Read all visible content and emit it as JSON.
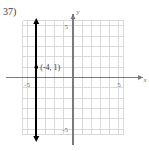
{
  "problem": {
    "number_label": "37)"
  },
  "chart_data": {
    "type": "line",
    "title": "",
    "xlabel": "x",
    "ylabel": "y",
    "xlim": [
      -6,
      6
    ],
    "ylim": [
      -6,
      6
    ],
    "grid": true,
    "grid_step": 1,
    "grid_color": "#d9d9d9",
    "axis_color": "#7a7a7a",
    "legend": "none",
    "x_tick_labels": [
      {
        "value": -5,
        "text": "-5"
      },
      {
        "value": 5,
        "text": "5"
      }
    ],
    "y_tick_labels": [
      {
        "value": 5,
        "text": "5"
      },
      {
        "value": -5,
        "text": "-5"
      }
    ],
    "series": [
      {
        "name": "x = -4",
        "type": "vertical-line",
        "x": -4,
        "y_from": -6,
        "y_to": 6,
        "color": "#000000",
        "arrows": "both",
        "linewidth": 1.6
      }
    ],
    "points": [
      {
        "x": -4,
        "y": 1,
        "label": "(-4, 1)",
        "color": "#000000",
        "marker": "dot"
      }
    ]
  }
}
